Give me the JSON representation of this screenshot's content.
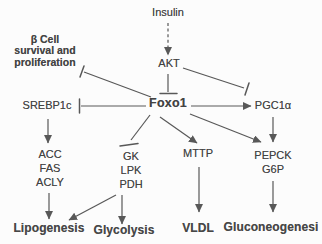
{
  "diagram": {
    "colors": {
      "background": "#fcfcfc",
      "line": "#585858",
      "text": "#434343"
    },
    "nodes": {
      "insulin": {
        "label": "Insulin"
      },
      "akt": {
        "label": "AKT"
      },
      "beta_cell": {
        "lines": [
          "β Cell",
          "survival and",
          "proliferation"
        ]
      },
      "srebp1c": {
        "label": "SREBP1c"
      },
      "foxo1": {
        "label": "Foxo1"
      },
      "pgc1a": {
        "label": "PGC1α"
      },
      "lipogenic_genes": {
        "lines": [
          "ACC",
          "FAS",
          "ACLY"
        ]
      },
      "glycolytic_genes": {
        "lines": [
          "GK",
          "LPK",
          "PDH"
        ]
      },
      "mttp": {
        "label": "MTTP"
      },
      "gluconeogenic_genes": {
        "lines": [
          "PEPCK",
          "G6P"
        ]
      },
      "lipogenesis": {
        "label": "Lipogenesis"
      },
      "glycolysis": {
        "label": "Glycolysis"
      },
      "vldl": {
        "label": "VLDL"
      },
      "gluconeogenesis": {
        "label": "Gluconeogenesi"
      }
    },
    "edges": [
      {
        "from": "Insulin",
        "to": "AKT",
        "effect": "activates",
        "line": "dashed-arrow"
      },
      {
        "from": "AKT",
        "to": "Foxo1",
        "effect": "inhibits",
        "line": "t-bar"
      },
      {
        "from": "AKT",
        "to": "PGC1α",
        "effect": "inhibits",
        "line": "t-bar"
      },
      {
        "from": "Foxo1",
        "to": "β Cell survival and proliferation",
        "effect": "inhibits",
        "line": "t-bar"
      },
      {
        "from": "Foxo1",
        "to": "SREBP1c",
        "effect": "inhibits",
        "line": "t-bar"
      },
      {
        "from": "Foxo1",
        "to": "PGC1α",
        "effect": "activates",
        "line": "arrow"
      },
      {
        "from": "Foxo1",
        "to": "GK LPK PDH",
        "effect": "inhibits",
        "line": "t-bar"
      },
      {
        "from": "Foxo1",
        "to": "MTTP",
        "effect": "activates",
        "line": "arrow"
      },
      {
        "from": "Foxo1",
        "to": "PEPCK G6P",
        "effect": "activates",
        "line": "arrow"
      },
      {
        "from": "SREBP1c",
        "to": "ACC FAS ACLY",
        "effect": "activates",
        "line": "arrow"
      },
      {
        "from": "ACC FAS ACLY",
        "to": "Lipogenesis",
        "effect": "activates",
        "line": "arrow"
      },
      {
        "from": "GK LPK PDH",
        "to": "Lipogenesis",
        "effect": "activates",
        "line": "arrow"
      },
      {
        "from": "GK LPK PDH",
        "to": "Glycolysis",
        "effect": "activates",
        "line": "arrow"
      },
      {
        "from": "MTTP",
        "to": "VLDL",
        "effect": "activates",
        "line": "arrow"
      },
      {
        "from": "PGC1α",
        "to": "PEPCK G6P",
        "effect": "activates",
        "line": "arrow"
      },
      {
        "from": "PEPCK G6P",
        "to": "Gluconeogenesi",
        "effect": "activates",
        "line": "arrow"
      }
    ]
  }
}
